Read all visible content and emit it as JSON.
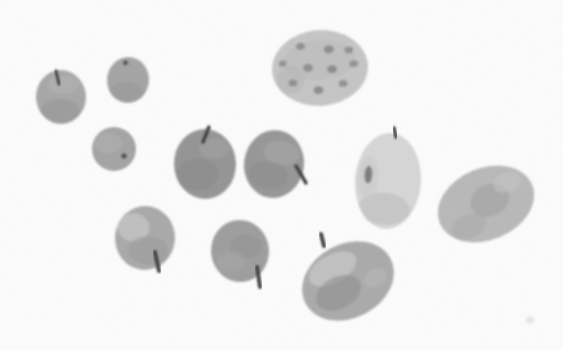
{
  "illustration": {
    "description": "Grayscale watercolor illustration of eleven scattered fruits (apples with small dark stems and oval melons, one spotted) on a plain white background",
    "background_color": "#ffffff",
    "stem_color": "#3f3f3f",
    "canvas": {
      "width": 563,
      "height": 350
    },
    "fruits": [
      {
        "name": "apple-small-top-left",
        "type": "apple",
        "cx": 61,
        "cy": 97,
        "rx": 25,
        "ry": 27,
        "rotate": -3,
        "color": "#a7a7a7",
        "patches": [
          {
            "dx": -2,
            "dy": 14,
            "rx": 20,
            "ry": 12,
            "color": "#949494",
            "opacity": 0.55
          },
          {
            "dx": 3,
            "dy": -12,
            "rx": 16,
            "ry": 9,
            "color": "#b5b5b5",
            "opacity": 0.5
          }
        ],
        "stem": {
          "x1": 56,
          "y1": 71,
          "x2": 59,
          "y2": 84,
          "width": 3
        }
      },
      {
        "name": "apple-round-top",
        "type": "apple",
        "cx": 128,
        "cy": 80,
        "rx": 21,
        "ry": 23,
        "rotate": 5,
        "color": "#a4a4a4",
        "patches": [
          {
            "dx": 0,
            "dy": 12,
            "rx": 17,
            "ry": 10,
            "color": "#939393",
            "opacity": 0.5
          }
        ],
        "spots": [
          {
            "dx": -4,
            "dy": -17,
            "rx": 2.6,
            "ry": 2.6,
            "color": "#454545",
            "opacity": 0.9
          }
        ]
      },
      {
        "name": "apple-round-middle-left",
        "type": "apple",
        "cx": 114,
        "cy": 149,
        "rx": 22,
        "ry": 22,
        "rotate": 0,
        "color": "#a4a4a4",
        "patches": [
          {
            "dx": -6,
            "dy": -6,
            "rx": 14,
            "ry": 10,
            "color": "#b2b2b2",
            "opacity": 0.5
          }
        ],
        "spots": [
          {
            "dx": 10,
            "dy": 7,
            "rx": 2.8,
            "ry": 2.8,
            "color": "#454545",
            "opacity": 0.9
          }
        ]
      },
      {
        "name": "apple-center",
        "type": "apple",
        "cx": 205,
        "cy": 164,
        "rx": 31,
        "ry": 35,
        "rotate": -2,
        "color": "#949494",
        "patches": [
          {
            "dx": -8,
            "dy": 10,
            "rx": 21,
            "ry": 16,
            "color": "#858585",
            "opacity": 0.5
          },
          {
            "dx": 10,
            "dy": -15,
            "rx": 15,
            "ry": 10,
            "color": "#a3a3a3",
            "opacity": 0.5
          }
        ],
        "stem": {
          "x1": 209,
          "y1": 127,
          "x2": 203,
          "y2": 142,
          "width": 3.5
        }
      },
      {
        "name": "apple-center-right",
        "type": "apple",
        "cx": 274,
        "cy": 164,
        "rx": 30,
        "ry": 34,
        "rotate": 8,
        "color": "#969696",
        "patches": [
          {
            "dx": 6,
            "dy": -12,
            "rx": 18,
            "ry": 12,
            "color": "#a9a9a9",
            "opacity": 0.55
          },
          {
            "dx": -4,
            "dy": 12,
            "rx": 20,
            "ry": 14,
            "color": "#898989",
            "opacity": 0.45
          }
        ],
        "stem": {
          "x1": 296,
          "y1": 166,
          "x2": 306,
          "y2": 183,
          "width": 3.5
        }
      },
      {
        "name": "spotted-melon-top",
        "type": "melon",
        "cx": 320,
        "cy": 68,
        "rx": 48,
        "ry": 38,
        "rotate": -4,
        "color": "#c6c6c6",
        "patches": [
          {
            "dx": 0,
            "dy": -8,
            "rx": 36,
            "ry": 20,
            "color": "#bdbdbd",
            "opacity": 0.6
          },
          {
            "dx": -30,
            "dy": 10,
            "rx": 14,
            "ry": 14,
            "color": "#b4b4b4",
            "opacity": 0.5
          }
        ],
        "spots": [
          {
            "dx": -18,
            "dy": -23,
            "rx": 4.5,
            "ry": 3.5,
            "color": "#8a8a8a",
            "opacity": 0.9
          },
          {
            "dx": 10,
            "dy": -18,
            "rx": 5,
            "ry": 4,
            "color": "#868686",
            "opacity": 0.9
          },
          {
            "dx": 30,
            "dy": -16,
            "rx": 4.5,
            "ry": 3.5,
            "color": "#8d8d8d",
            "opacity": 0.9
          },
          {
            "dx": -37,
            "dy": -7,
            "rx": 4,
            "ry": 3.2,
            "color": "#8d8d8d",
            "opacity": 0.9
          },
          {
            "dx": -12,
            "dy": -1,
            "rx": 5,
            "ry": 4,
            "color": "#888888",
            "opacity": 0.9
          },
          {
            "dx": 12,
            "dy": 2,
            "rx": 5,
            "ry": 4,
            "color": "#858585",
            "opacity": 0.9
          },
          {
            "dx": 34,
            "dy": -2,
            "rx": 4.5,
            "ry": 3.5,
            "color": "#8d8d8d",
            "opacity": 0.9
          },
          {
            "dx": -28,
            "dy": 13,
            "rx": 4.5,
            "ry": 3.5,
            "color": "#8a8a8a",
            "opacity": 0.9
          },
          {
            "dx": -3,
            "dy": 22,
            "rx": 5,
            "ry": 4,
            "color": "#868686",
            "opacity": 0.9
          },
          {
            "dx": 22,
            "dy": 17,
            "rx": 4.5,
            "ry": 3.5,
            "color": "#8b8b8b",
            "opacity": 0.9
          }
        ]
      },
      {
        "name": "pale-oval-melon",
        "type": "melon",
        "cx": 388,
        "cy": 181,
        "rx": 33,
        "ry": 48,
        "rotate": 4,
        "color": "#d7d7d7",
        "patches": [
          {
            "dx": -2,
            "dy": 28,
            "rx": 26,
            "ry": 16,
            "color": "#c2c2c2",
            "opacity": 0.7
          },
          {
            "dx": -20,
            "dy": -2,
            "rx": 10,
            "ry": 22,
            "color": "#cbcbcb",
            "opacity": 0.6
          }
        ],
        "spots": [
          {
            "dx": -20,
            "dy": -5,
            "rx": 4,
            "ry": 9,
            "color": "#6e6e6e",
            "opacity": 0.85
          }
        ],
        "stem": {
          "x1": 394,
          "y1": 128,
          "x2": 396,
          "y2": 137,
          "width": 3.5
        }
      },
      {
        "name": "large-melon-right",
        "type": "melon",
        "cx": 486,
        "cy": 204,
        "rx": 50,
        "ry": 36,
        "rotate": -23,
        "color": "#b9b9b9",
        "patches": [
          {
            "dx": 5,
            "dy": -2,
            "rx": 20,
            "ry": 16,
            "color": "#a0a0a0",
            "opacity": 0.6
          },
          {
            "dx": -25,
            "dy": 14,
            "rx": 18,
            "ry": 12,
            "color": "#a7a7a7",
            "opacity": 0.5
          },
          {
            "dx": 28,
            "dy": -12,
            "rx": 14,
            "ry": 10,
            "color": "#c5c5c5",
            "opacity": 0.6
          }
        ]
      },
      {
        "name": "tilted-melon-bottom",
        "type": "melon",
        "cx": 348,
        "cy": 281,
        "rx": 48,
        "ry": 37,
        "rotate": -28,
        "color": "#aaaaaa",
        "patches": [
          {
            "dx": -8,
            "dy": -18,
            "rx": 26,
            "ry": 14,
            "color": "#cacaca",
            "opacity": 0.7
          },
          {
            "dx": -14,
            "dy": 6,
            "rx": 24,
            "ry": 16,
            "color": "#8e8e8e",
            "opacity": 0.6
          },
          {
            "dx": 26,
            "dy": 10,
            "rx": 12,
            "ry": 9,
            "color": "#b9b9b9",
            "opacity": 0.5
          }
        ],
        "stem": {
          "x1": 321,
          "y1": 234,
          "x2": 324,
          "y2": 246,
          "width": 4
        }
      },
      {
        "name": "apple-bottom-left",
        "type": "apple",
        "cx": 145,
        "cy": 238,
        "rx": 30,
        "ry": 32,
        "rotate": 3,
        "color": "#a9a9a9",
        "patches": [
          {
            "dx": -12,
            "dy": -10,
            "rx": 16,
            "ry": 14,
            "color": "#c6c6c6",
            "opacity": 0.8
          },
          {
            "dx": 4,
            "dy": 12,
            "rx": 20,
            "ry": 14,
            "color": "#989898",
            "opacity": 0.5
          }
        ],
        "stem": {
          "x1": 155,
          "y1": 252,
          "x2": 159,
          "y2": 271,
          "width": 4
        }
      },
      {
        "name": "apple-bottom-middle",
        "type": "apple",
        "cx": 240,
        "cy": 251,
        "rx": 29,
        "ry": 31,
        "rotate": -5,
        "color": "#9d9d9d",
        "patches": [
          {
            "dx": 6,
            "dy": -4,
            "rx": 16,
            "ry": 12,
            "color": "#919191",
            "opacity": 0.5
          },
          {
            "dx": -10,
            "dy": 10,
            "rx": 14,
            "ry": 10,
            "color": "#a9a9a9",
            "opacity": 0.5
          }
        ],
        "stem": {
          "x1": 257,
          "y1": 267,
          "x2": 260,
          "y2": 287,
          "width": 4
        }
      },
      {
        "name": "paper-speck",
        "type": "speck",
        "cx": 530,
        "cy": 320,
        "rx": 4,
        "ry": 4,
        "rotate": 0,
        "color": "#eaeaea",
        "patches": []
      }
    ]
  }
}
